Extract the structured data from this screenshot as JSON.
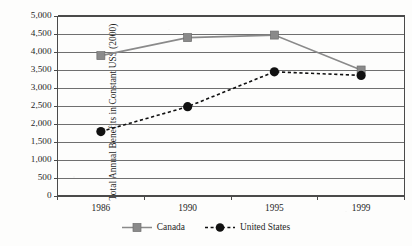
{
  "chart_data": {
    "type": "line",
    "title": "",
    "xlabel": "",
    "ylabel": "Total Annual Benefits in Constant US$ (2000)",
    "categories": [
      "1986",
      "1990",
      "1995",
      "1999"
    ],
    "ylim": [
      0,
      5000
    ],
    "ytick_labels": [
      "5,000",
      "4,500",
      "4,000",
      "3,500",
      "3,000",
      "2,500",
      "2,000",
      "1,500",
      "1,000",
      "500",
      "0"
    ],
    "ytick_values": [
      5000,
      4500,
      4000,
      3500,
      3000,
      2500,
      2000,
      1500,
      1000,
      500,
      0
    ],
    "grid": "horizontal",
    "legend_position": "bottom-center",
    "series": [
      {
        "name": "Canada",
        "values": [
          3900,
          4400,
          4470,
          3500
        ],
        "color": "#8a8a8a",
        "marker": "square",
        "linestyle": "solid"
      },
      {
        "name": "United States",
        "values": [
          1790,
          2480,
          3450,
          3350
        ],
        "color": "#111111",
        "marker": "circle",
        "linestyle": "dashed"
      }
    ]
  },
  "legend": {
    "items": [
      {
        "label": "Canada"
      },
      {
        "label": "United States"
      }
    ]
  },
  "colors": {
    "canada": "#8a8a8a",
    "united_states": "#111111",
    "grid": "#6f6f6f",
    "axis": "#4a4a4a",
    "text": "#1f1f1f"
  }
}
